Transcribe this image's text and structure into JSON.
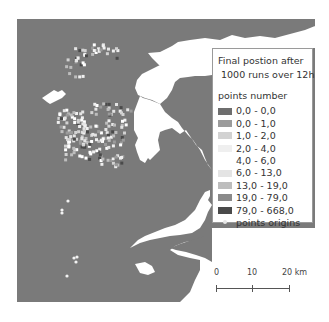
{
  "legend": {
    "title_line1": "Final postion after",
    "title_line2": "1000 runs over 12h",
    "subtitle": "points number",
    "items": [
      {
        "label": "0,0 - 0,0",
        "color": "#6e6e6e"
      },
      {
        "label": "0,0 - 1,0",
        "color": "#9b9b9b"
      },
      {
        "label": "1,0 - 2,0",
        "color": "#d2d2d2"
      },
      {
        "label": "2,0 - 4,0",
        "color": "#efefef"
      },
      {
        "label": "4,0 - 6,0",
        "color": "#ffffff"
      },
      {
        "label": "6,0 - 13,0",
        "color": "#e4e4e4"
      },
      {
        "label": "13,0 - 19,0",
        "color": "#bdbdbd"
      },
      {
        "label": "19,0 - 79,0",
        "color": "#8a8a8a"
      },
      {
        "label": "79,0 - 668,0",
        "color": "#4a4a4a"
      }
    ],
    "origins_label": "points origins"
  },
  "scale_bar": {
    "labels": [
      "0",
      "10",
      "20 km"
    ]
  },
  "colors": {
    "sea": "#7a7a7a",
    "land": "#ffffff"
  }
}
